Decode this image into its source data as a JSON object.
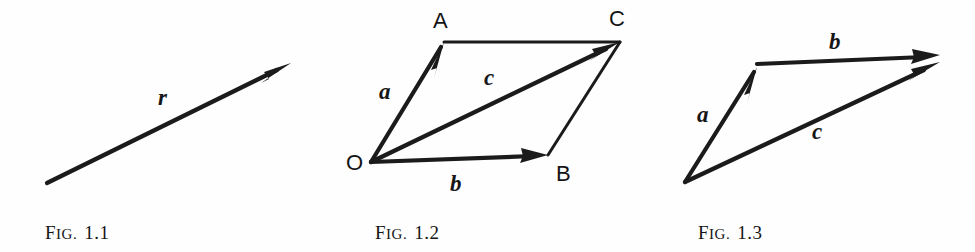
{
  "plate": {
    "title": "Vector addition figures",
    "background_color": "#fefefe",
    "ink_color": "#1b1b1b"
  },
  "figures": [
    {
      "id": "fig-1-1",
      "caption_lead": "F",
      "caption_small": "IG.",
      "caption_number": "1.1",
      "caption_full": "Fig. 1.1",
      "description": "Single bold arrow pointing up-right labelled r",
      "vectors": [
        {
          "name": "r",
          "label": "r",
          "from": [
            47,
            183
          ],
          "to": [
            291,
            63
          ],
          "style": "thick"
        }
      ],
      "point_labels": [],
      "vector_labels": [
        {
          "text": "r",
          "x": 158,
          "y": 95
        }
      ]
    },
    {
      "id": "fig-1-2",
      "caption_lead": "F",
      "caption_small": "IG.",
      "caption_number": "1.2",
      "caption_full": "Fig. 1.2",
      "description": "Parallelogram OACB with vectors a, b and resultant diagonal c",
      "points": [
        {
          "name": "O",
          "label": "O",
          "x": 371,
          "y": 162
        },
        {
          "name": "A",
          "label": "A",
          "x": 444,
          "y": 42
        },
        {
          "name": "B",
          "label": "B",
          "x": 548,
          "y": 155
        },
        {
          "name": "C",
          "label": "C",
          "x": 620,
          "y": 42
        }
      ],
      "vectors": [
        {
          "name": "a",
          "label": "a",
          "from": [
            371,
            162
          ],
          "to": [
            444,
            42
          ],
          "style": "thick",
          "arrow": true
        },
        {
          "name": "b",
          "label": "b",
          "from": [
            371,
            162
          ],
          "to": [
            548,
            155
          ],
          "style": "thick",
          "arrow": true
        },
        {
          "name": "c",
          "label": "c",
          "from": [
            371,
            162
          ],
          "to": [
            620,
            42
          ],
          "style": "thick",
          "arrow": true
        },
        {
          "name": "AC",
          "label": "",
          "from": [
            444,
            42
          ],
          "to": [
            620,
            42
          ],
          "style": "thin",
          "arrow": false
        },
        {
          "name": "BC",
          "label": "",
          "from": [
            548,
            155
          ],
          "to": [
            620,
            42
          ],
          "style": "thin",
          "arrow": false
        }
      ],
      "point_labels": [
        {
          "text": "A",
          "x": 433,
          "y": 10
        },
        {
          "text": "C",
          "x": 609,
          "y": 8
        },
        {
          "text": "O",
          "x": 346,
          "y": 152
        },
        {
          "text": "B",
          "x": 556,
          "y": 163
        }
      ],
      "vector_labels": [
        {
          "text": "a",
          "x": 379,
          "y": 80
        },
        {
          "text": "b",
          "x": 450,
          "y": 172
        },
        {
          "text": "c",
          "x": 484,
          "y": 68
        }
      ]
    },
    {
      "id": "fig-1-3",
      "caption_lead": "F",
      "caption_small": "IG.",
      "caption_number": "1.3",
      "caption_full": "Fig. 1.3",
      "description": "Triangle law of addition: vector a then vector b head-to-tail, resultant c",
      "vectors": [
        {
          "name": "a",
          "label": "a",
          "from": [
            685,
            182
          ],
          "to": [
            757,
            67
          ],
          "style": "thick",
          "arrow": true
        },
        {
          "name": "b",
          "label": "b",
          "from": [
            757,
            64
          ],
          "to": [
            938,
            56
          ],
          "style": "thick",
          "arrow": true
        },
        {
          "name": "c",
          "label": "c",
          "from": [
            685,
            182
          ],
          "to": [
            938,
            63
          ],
          "style": "thick",
          "arrow": true
        }
      ],
      "point_labels": [],
      "vector_labels": [
        {
          "text": "a",
          "x": 697,
          "y": 103
        },
        {
          "text": "b",
          "x": 829,
          "y": 32
        },
        {
          "text": "c",
          "x": 812,
          "y": 120
        }
      ]
    }
  ]
}
